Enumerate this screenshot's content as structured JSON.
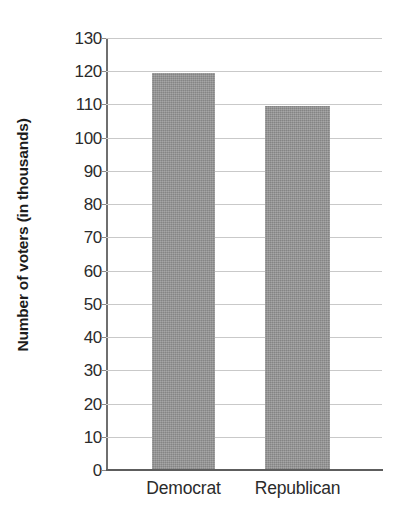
{
  "chart_data": {
    "type": "bar",
    "title": "",
    "subtitle": "",
    "xlabel": "",
    "ylabel": "Number of voters (in thousands)",
    "categories": [
      "Democrat",
      "Republican"
    ],
    "values": [
      119.5,
      109.5
    ],
    "series": [
      {
        "name": "Number of voters",
        "values": [
          119.5,
          109.5
        ]
      }
    ],
    "ylim": [
      0,
      130
    ],
    "ytick_step": 10,
    "ytick_labels": [
      "0",
      "10",
      "20",
      "30",
      "40",
      "50",
      "60",
      "70",
      "80",
      "90",
      "100",
      "110",
      "120",
      "130"
    ],
    "ytick_values": [
      0,
      10,
      20,
      30,
      40,
      50,
      60,
      70,
      80,
      90,
      100,
      110,
      120,
      130
    ],
    "grid": true,
    "grid_axis": "y",
    "legend": false,
    "legend_position": "none",
    "annotations": [],
    "colors": {
      "bar_fill": "#949494",
      "gridline": "#c9c9c9",
      "axis": "#5d5d5d",
      "text": "#2b2b2b",
      "title_text": "#1c1c1c",
      "background": "#ffffff"
    }
  },
  "bars": [
    {
      "category": "Democrat",
      "value": 119.5
    },
    {
      "category": "Republican",
      "value": 109.5
    }
  ]
}
